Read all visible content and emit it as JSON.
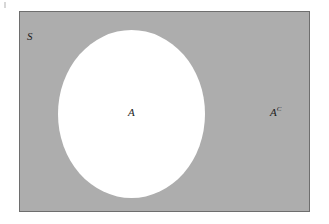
{
  "figure": {
    "type": "venn-diagram",
    "background_color": "#ffffff",
    "sample_space": {
      "label": "S",
      "fill_color": "#adadad",
      "border_color": "#6e6e6e",
      "shape": "rectangle"
    },
    "event": {
      "label": "A",
      "fill_color": "#ffffff",
      "shape": "ellipse"
    },
    "complement": {
      "base": "A",
      "superscript": "C",
      "shaded": true
    },
    "artifact": {
      "name": "scan-speck",
      "color": "#c9c9c9"
    }
  }
}
